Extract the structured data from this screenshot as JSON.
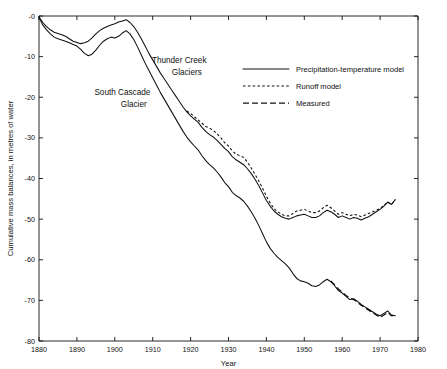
{
  "chart_data": {
    "type": "line",
    "title": "",
    "xlabel": "Year",
    "ylabel": "Cumulative mass balances, in metres of water",
    "xlim": [
      1880,
      1980
    ],
    "ylim": [
      -80,
      0
    ],
    "xticks": [
      1880,
      1890,
      1900,
      1910,
      1920,
      1930,
      1940,
      1950,
      1960,
      1970,
      1980
    ],
    "yticks": [
      0,
      -10,
      -20,
      -30,
      -40,
      -50,
      -60,
      -70,
      -80
    ],
    "ytick_labels": [
      "-0",
      "-10",
      "-20",
      "-30",
      "-40",
      "-50",
      "-60",
      "-70",
      "-80"
    ],
    "grid": false,
    "legend_position": "upper-right-inset",
    "legend": [
      {
        "label": "Precipitation-temperature model",
        "style": "solid"
      },
      {
        "label": "Runoff model",
        "style": "dotted"
      },
      {
        "label": "Measured",
        "style": "dashed"
      }
    ],
    "annotations": [
      {
        "text": "Thunder Creek",
        "x": 1917,
        "y": -11.5
      },
      {
        "text": "Glaciers",
        "x": 1919,
        "y": -14.5
      },
      {
        "text": "South Cascade",
        "x": 1902,
        "y": -19.5
      },
      {
        "text": "Glacier",
        "x": 1905,
        "y": -22.5
      }
    ],
    "series": [
      {
        "name": "Thunder Creek Glaciers - Precipitation-temperature model",
        "style": "solid",
        "x": [
          1880,
          1881,
          1882,
          1883,
          1884,
          1885,
          1886,
          1887,
          1888,
          1889,
          1890,
          1891,
          1892,
          1893,
          1894,
          1895,
          1896,
          1897,
          1898,
          1899,
          1900,
          1901,
          1902,
          1903,
          1904,
          1905,
          1906,
          1907,
          1908,
          1909,
          1910,
          1911,
          1912,
          1913,
          1914,
          1915,
          1916,
          1917,
          1918,
          1919,
          1920,
          1921,
          1922,
          1923,
          1924,
          1925,
          1926,
          1927,
          1928,
          1929,
          1930,
          1931,
          1932,
          1933,
          1934,
          1935,
          1936,
          1937,
          1938,
          1939,
          1940,
          1941,
          1942,
          1943,
          1944,
          1945,
          1946,
          1947,
          1948,
          1949,
          1950,
          1951,
          1952,
          1953,
          1954,
          1955,
          1956,
          1957,
          1958,
          1959,
          1960,
          1961,
          1962,
          1963,
          1964,
          1965,
          1966,
          1967,
          1968,
          1969,
          1970,
          1971,
          1972,
          1973,
          1974
        ],
        "y": [
          -0.2,
          -1.6,
          -2.6,
          -3.4,
          -4.0,
          -4.3,
          -4.6,
          -5.0,
          -5.6,
          -6.2,
          -6.5,
          -6.8,
          -6.6,
          -6.2,
          -5.4,
          -4.4,
          -3.6,
          -3.0,
          -2.6,
          -2.2,
          -1.9,
          -1.5,
          -1.2,
          -0.9,
          -1.6,
          -2.6,
          -4.0,
          -5.6,
          -7.4,
          -9.2,
          -10.8,
          -12.4,
          -14.0,
          -15.4,
          -16.8,
          -18.2,
          -19.6,
          -21.0,
          -22.4,
          -23.6,
          -24.6,
          -25.4,
          -26.2,
          -27.4,
          -28.4,
          -29.2,
          -29.8,
          -30.6,
          -31.6,
          -32.6,
          -33.4,
          -34.6,
          -35.4,
          -36.0,
          -36.6,
          -37.6,
          -38.8,
          -40.2,
          -41.8,
          -43.6,
          -45.4,
          -46.8,
          -48.0,
          -48.8,
          -49.4,
          -49.8,
          -50.0,
          -49.6,
          -49.2,
          -49.0,
          -48.8,
          -49.2,
          -49.6,
          -49.6,
          -49.2,
          -48.4,
          -47.8,
          -48.2,
          -48.8,
          -49.6,
          -49.2,
          -49.6,
          -50.0,
          -49.6,
          -49.8,
          -50.2,
          -49.8,
          -49.4,
          -48.8,
          -48.2,
          -47.6,
          -46.8,
          -45.8,
          -46.4,
          -45.2
        ]
      },
      {
        "name": "Thunder Creek Glaciers - Runoff model",
        "style": "dotted",
        "x": [
          1919,
          1920,
          1921,
          1922,
          1923,
          1924,
          1925,
          1926,
          1927,
          1928,
          1929,
          1930,
          1931,
          1932,
          1933,
          1934,
          1935,
          1936,
          1937,
          1938,
          1939,
          1940,
          1941,
          1942,
          1943,
          1944,
          1945,
          1946,
          1947,
          1948,
          1949,
          1950,
          1951,
          1952,
          1953,
          1954,
          1955,
          1956,
          1957,
          1958,
          1959,
          1960,
          1961,
          1962,
          1963,
          1964,
          1965,
          1966,
          1967,
          1968,
          1969,
          1970,
          1971,
          1972,
          1973,
          1974
        ],
        "y": [
          -23.4,
          -24.0,
          -24.8,
          -25.6,
          -26.4,
          -27.2,
          -27.6,
          -28.2,
          -29.0,
          -30.0,
          -31.2,
          -32.0,
          -33.2,
          -34.0,
          -34.4,
          -34.8,
          -36.0,
          -37.4,
          -39.0,
          -40.6,
          -42.4,
          -44.4,
          -46.0,
          -47.4,
          -48.2,
          -48.8,
          -49.2,
          -49.2,
          -48.6,
          -48.0,
          -47.8,
          -47.6,
          -48.0,
          -48.4,
          -48.4,
          -48.0,
          -47.2,
          -46.6,
          -47.2,
          -48.0,
          -48.8,
          -48.4,
          -48.8,
          -49.2,
          -48.8,
          -49.0,
          -49.4,
          -49.0,
          -48.6,
          -48.2,
          -47.8,
          -47.4,
          -46.6,
          -45.8,
          -46.4,
          -45.2
        ]
      },
      {
        "name": "South Cascade Glacier - Precipitation-temperature model",
        "style": "solid",
        "x": [
          1880,
          1881,
          1882,
          1883,
          1884,
          1885,
          1886,
          1887,
          1888,
          1889,
          1890,
          1891,
          1892,
          1893,
          1894,
          1895,
          1896,
          1897,
          1898,
          1899,
          1900,
          1901,
          1902,
          1903,
          1904,
          1905,
          1906,
          1907,
          1908,
          1909,
          1910,
          1911,
          1912,
          1913,
          1914,
          1915,
          1916,
          1917,
          1918,
          1919,
          1920,
          1921,
          1922,
          1923,
          1924,
          1925,
          1926,
          1927,
          1928,
          1929,
          1930,
          1931,
          1932,
          1933,
          1934,
          1935,
          1936,
          1937,
          1938,
          1939,
          1940,
          1941,
          1942,
          1943,
          1944,
          1945,
          1946,
          1947,
          1948,
          1949,
          1950,
          1951,
          1952,
          1953,
          1954,
          1955,
          1956,
          1957,
          1958,
          1959,
          1960,
          1961,
          1962,
          1963,
          1964,
          1965,
          1966,
          1967,
          1968,
          1969,
          1970,
          1971,
          1972,
          1973,
          1974
        ],
        "y": [
          -0.4,
          -2.2,
          -3.4,
          -4.4,
          -5.2,
          -5.6,
          -5.9,
          -6.2,
          -6.6,
          -7.0,
          -7.4,
          -8.2,
          -9.2,
          -9.8,
          -9.4,
          -8.4,
          -7.2,
          -6.2,
          -5.6,
          -5.2,
          -5.4,
          -5.0,
          -4.2,
          -3.6,
          -4.4,
          -5.8,
          -7.6,
          -9.6,
          -11.6,
          -13.4,
          -15.2,
          -17.0,
          -18.8,
          -20.4,
          -22.0,
          -23.6,
          -25.2,
          -26.8,
          -28.4,
          -29.8,
          -31.0,
          -32.0,
          -33.0,
          -34.4,
          -35.6,
          -36.6,
          -37.4,
          -38.4,
          -39.6,
          -41.0,
          -42.0,
          -43.4,
          -44.2,
          -44.8,
          -45.6,
          -46.8,
          -48.2,
          -49.8,
          -51.6,
          -53.6,
          -55.6,
          -57.2,
          -58.4,
          -59.4,
          -60.2,
          -61.0,
          -62.0,
          -63.4,
          -64.6,
          -65.2,
          -65.4,
          -65.8,
          -66.4,
          -66.6,
          -66.2,
          -65.4,
          -64.8,
          -65.4,
          -66.4,
          -67.6,
          -68.2,
          -69.0,
          -69.8,
          -69.6,
          -70.2,
          -71.0,
          -71.6,
          -72.2,
          -72.8,
          -73.4,
          -73.8,
          -73.2,
          -72.6,
          -73.6,
          -73.8
        ]
      },
      {
        "name": "South Cascade Glacier - Measured",
        "style": "dashed",
        "x": [
          1957,
          1958,
          1959,
          1960,
          1961,
          1962,
          1963,
          1964,
          1965,
          1966,
          1967,
          1968,
          1969,
          1970,
          1971,
          1972,
          1973,
          1974
        ],
        "y": [
          -65.2,
          -66.2,
          -67.2,
          -68.0,
          -68.8,
          -69.4,
          -69.8,
          -70.4,
          -71.2,
          -71.8,
          -72.4,
          -73.0,
          -73.6,
          -74.2,
          -73.6,
          -73.0,
          -73.8,
          -73.6
        ]
      }
    ]
  }
}
